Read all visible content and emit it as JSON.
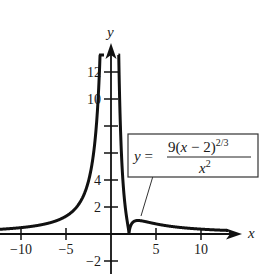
{
  "chart_data": {
    "type": "line",
    "title": "",
    "xlabel": "x",
    "ylabel": "y",
    "xlim": [
      -12,
      14
    ],
    "ylim": [
      -2.5,
      14
    ],
    "grid": false,
    "legend_position": "none",
    "x_ticks": [
      -10,
      -5,
      5,
      10
    ],
    "x_tick_labels": [
      "−10",
      "−5",
      "5",
      "10"
    ],
    "y_ticks": [
      -2,
      2,
      4,
      6,
      8,
      10,
      12
    ],
    "y_tick_labels": [
      "−2",
      "2",
      "4",
      "",
      "",
      "10",
      "12"
    ],
    "series": [
      {
        "name": "y = 9(x − 2)^(2/3) / x^2",
        "formula": "9*(x-2)^(2/3)/x^2",
        "vertical_asymptote": 0,
        "cusp": [
          2,
          0
        ],
        "local_max_approx": [
          3,
          1.0
        ],
        "x": [
          -12,
          -10,
          -8,
          -6,
          -5,
          -4,
          -3,
          -2,
          -1.5,
          -1.2,
          -1,
          0.8,
          1,
          1.5,
          1.8,
          2,
          2.5,
          3,
          4,
          5,
          6,
          8,
          10,
          12,
          13
        ],
        "y": [
          0.34,
          0.45,
          0.65,
          0.99,
          1.28,
          1.71,
          2.36,
          3.57,
          4.84,
          6.18,
          7.49,
          15.9,
          9.0,
          2.53,
          1.2,
          0,
          0.91,
          1.0,
          0.89,
          0.75,
          0.63,
          0.46,
          0.36,
          0.29,
          0.25
        ]
      }
    ],
    "annotations": [
      {
        "type": "label_box",
        "text": "y = 9(x − 2)^{2/3} / x^2",
        "lhs": "y =",
        "numerator": "9(x − 2)",
        "exponent": "2/3",
        "denominator": "x",
        "denominator_exponent": "2",
        "points_to": [
          3.5,
          1.0
        ]
      }
    ]
  },
  "labels": {
    "x_axis": "x",
    "y_axis": "y",
    "eq_lhs": "y =",
    "eq_num": "9(x − 2)",
    "eq_num_exp": "2/3",
    "eq_den": "x",
    "eq_den_exp": "2"
  },
  "colors": {
    "curve": "#111111",
    "axes": "#111111",
    "background": "#ffffff"
  }
}
